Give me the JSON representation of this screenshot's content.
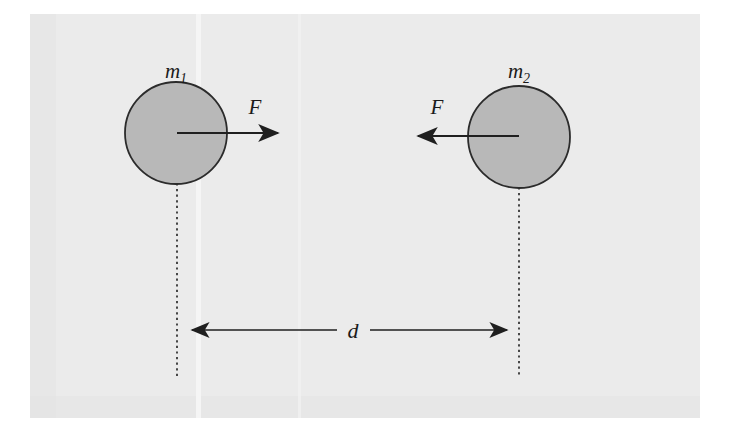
{
  "figure": {
    "canvas": {
      "width": 730,
      "height": 436
    },
    "background": {
      "page_color": "#ffffff",
      "scan_color": "#ebebeb",
      "scan_rect": {
        "x": 30,
        "y": 14,
        "width": 670,
        "height": 404
      }
    },
    "style": {
      "body_fill": "#b8b8b8",
      "body_stroke": "#2b2b2b",
      "line_color": "#1f1f1f",
      "label_color": "#1a1a1a",
      "stroke_width": 1.8,
      "dotted_width": 1.6
    },
    "bodies": [
      {
        "name": "mass-one",
        "label": "m",
        "subscript": "1",
        "center_x": 176,
        "center_y": 133,
        "radius": 51,
        "label_x": 176,
        "label_y": 78
      },
      {
        "name": "mass-two",
        "label": "m",
        "subscript": "2",
        "center_x": 519,
        "center_y": 137,
        "radius": 51,
        "label_x": 519,
        "label_y": 78
      }
    ],
    "force_vectors": [
      {
        "name": "force-on-mass-one",
        "label": "F",
        "direction": "right",
        "start_x": 177,
        "start_y": 133,
        "end_x": 283,
        "end_y": 133,
        "label_x": 255,
        "label_y": 114
      },
      {
        "name": "force-on-mass-two",
        "label": "F",
        "direction": "left",
        "start_x": 519,
        "start_y": 136,
        "end_x": 413,
        "end_y": 136,
        "label_x": 437,
        "label_y": 114
      }
    ],
    "reference_lines": [
      {
        "name": "center-line-left",
        "x": 177,
        "y_top": 133,
        "y_bottom": 376
      },
      {
        "name": "center-line-right",
        "x": 519,
        "y_top": 137,
        "y_bottom": 376
      }
    ],
    "separation": {
      "name": "separation-distance",
      "label": "d",
      "y": 330,
      "left_x": 187,
      "right_x": 512,
      "gap_left_x": 337,
      "gap_right_x": 370,
      "label_x": 353,
      "label_y": 338
    }
  }
}
